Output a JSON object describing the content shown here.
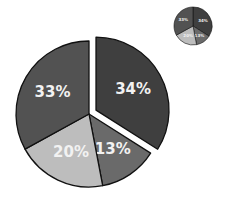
{
  "chart_data": {
    "type": "pie",
    "title": "",
    "categories": [
      "A",
      "B",
      "C",
      "D"
    ],
    "values": [
      34,
      13,
      20,
      33
    ],
    "labels": [
      "34%",
      "13%",
      "20%",
      "33%"
    ],
    "colors": [
      "#3f3f3f",
      "#6a6a6a",
      "#bdbdbd",
      "#525252"
    ],
    "exploded": [
      true,
      false,
      false,
      false
    ],
    "start_angle_deg": 0,
    "direction": "clockwise",
    "legend": null,
    "inset_thumbnail": {
      "labels": [
        "34%",
        "13%",
        "20%",
        "33%"
      ]
    }
  }
}
